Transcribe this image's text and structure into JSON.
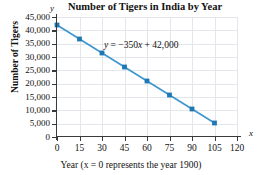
{
  "chart_data": {
    "type": "line",
    "title": "Number of Tigers in India by Year",
    "xlabel": "Year (x = 0 represents the year 1900)",
    "ylabel": "Number of Tigers",
    "x": [
      0,
      15,
      30,
      45,
      60,
      75,
      90,
      105
    ],
    "values": [
      42000,
      36750,
      31500,
      26250,
      21000,
      15750,
      10500,
      5250
    ],
    "series": [
      {
        "name": "Number of Tigers",
        "values": [
          42000,
          36750,
          31500,
          26250,
          21000,
          15750,
          10500,
          5250
        ]
      }
    ],
    "annotation": "y = −350x + 42,000",
    "equation_parts": {
      "lhs": "y",
      "equals": "=",
      "slope": "−350",
      "variable": "x",
      "plus": "+",
      "intercept": "42,000"
    },
    "xlim": [
      0,
      120
    ],
    "ylim": [
      0,
      45000
    ],
    "xticks": [
      0,
      15,
      30,
      45,
      60,
      75,
      90,
      105,
      120
    ],
    "xtick_labels": [
      "0",
      "15",
      "30",
      "45",
      "60",
      "75",
      "90",
      "105",
      "120"
    ],
    "yticks": [
      0,
      5000,
      10000,
      15000,
      20000,
      25000,
      30000,
      35000,
      40000,
      45000
    ],
    "ytick_labels": [
      "0",
      "5,000",
      "10,000",
      "15,000",
      "20,000",
      "25,000",
      "30,000",
      "35,000",
      "40,000",
      "45,000"
    ],
    "x_axis_letter": "x",
    "y_axis_letter": "y",
    "grid": true,
    "legend": null,
    "colors": {
      "line": "#3d96cf",
      "marker": "#1f78b4",
      "grid": "#e3e6ea",
      "axis": "#3a3a3a",
      "text": "#111111"
    }
  }
}
